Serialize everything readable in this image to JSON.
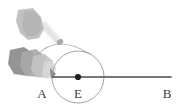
{
  "figure": {
    "canvas": {
      "width": 190,
      "height": 111,
      "background": "#ffffff"
    }
  },
  "colors": {
    "line": "#4a4a4a",
    "point": "#1e1e1e",
    "circle": "#9a9a9a",
    "arc": "#b5b5b5",
    "beam_light": "#efefef",
    "beam_mid": "#dcdcdc",
    "object_dark": "#8e8e8e",
    "object_mid": "#a8a8a8",
    "object_light": "#c4c4c4",
    "object_faint": "#d8d8d8",
    "label": "#3a3a3a"
  },
  "geometry": {
    "center": {
      "name": "E",
      "x": 78,
      "y": 77
    },
    "circle": {
      "cx": 78,
      "cy": 77,
      "r": 26,
      "stroke_width": 0.9
    },
    "baseline": {
      "x1": 53,
      "y1": 77,
      "x2": 171,
      "y2": 77,
      "stroke_width": 1.6
    },
    "point_dot": {
      "cx": 78,
      "cy": 77,
      "r": 3.1
    },
    "motion_arc": {
      "start": {
        "x": 36,
        "y": 56
      },
      "control": {
        "x": 57,
        "y": 34
      },
      "end": {
        "x": 90,
        "y": 53
      },
      "stroke_width": 1.1
    },
    "arc_marker": {
      "cx": 60,
      "cy": 42,
      "rx": 3.4,
      "ry": 2.6,
      "rotation": -28
    }
  },
  "labels": [
    {
      "id": "label-a",
      "text": "A",
      "x": 42,
      "y": 98
    },
    {
      "id": "label-e",
      "text": "E",
      "x": 78,
      "y": 98
    },
    {
      "id": "label-b",
      "text": "B",
      "x": 167,
      "y": 98
    }
  ],
  "objects": {
    "upper": {
      "name": "beam-emitter-upper",
      "description": "light-gray emitter body with a pale conical beam aimed down-right toward the arc marker",
      "body_points": "18,10 33,8 41,17 44,29 39,38 28,40 20,33 16,21",
      "beam_points": "41,28 44,20 61,41 58,45"
    },
    "lower": {
      "name": "beam-emitter-lower-trails",
      "description": "rotating emitter shown with three ghosted motion-trail copies pointing right toward point A",
      "trails": [
        {
          "points": "10,50 24,47 34,54 36,68 28,76 14,74 8,64",
          "fill_key": "object_dark",
          "opacity": 0.95
        },
        {
          "points": "22,52 36,49 46,57 48,70 40,77 26,76 20,66",
          "fill_key": "object_mid",
          "opacity": 0.9
        },
        {
          "points": "33,56 45,54 53,61 54,72 47,78 36,77 31,69",
          "fill_key": "object_light",
          "opacity": 0.9
        },
        {
          "points": "44,62 52,61 56,68 54,76 47,79 42,74",
          "fill_key": "object_faint",
          "opacity": 0.9
        }
      ],
      "tip": "52,70 56,74 53,78"
    }
  },
  "annotations": {
    "rotation_hint": "arc with marker indicates emitter swings from upper position down to baseline A-E-B"
  }
}
